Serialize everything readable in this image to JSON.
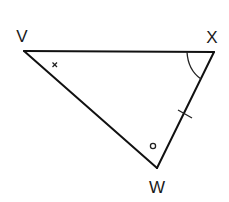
{
  "diagram": {
    "type": "triangle",
    "vertices": [
      {
        "id": "V",
        "label": "V",
        "x": 24,
        "y": 51,
        "label_x": 22,
        "label_y": 42
      },
      {
        "id": "X",
        "label": "X",
        "x": 214,
        "y": 52,
        "label_x": 212,
        "label_y": 43
      },
      {
        "id": "W",
        "label": "W",
        "x": 157,
        "y": 168,
        "label_x": 157,
        "label_y": 193
      }
    ],
    "edges": [
      {
        "from": "V",
        "to": "X"
      },
      {
        "from": "X",
        "to": "W"
      },
      {
        "from": "W",
        "to": "V"
      }
    ],
    "angle_markers": [
      {
        "vertex": "V",
        "symbol": "×"
      },
      {
        "vertex": "X",
        "symbol": "arc"
      },
      {
        "vertex": "W",
        "symbol": "o"
      }
    ],
    "side_markers": [
      {
        "side": "XW",
        "symbol": "single-tick"
      }
    ],
    "colors": {
      "stroke": "#111111",
      "background": "#ffffff"
    }
  }
}
